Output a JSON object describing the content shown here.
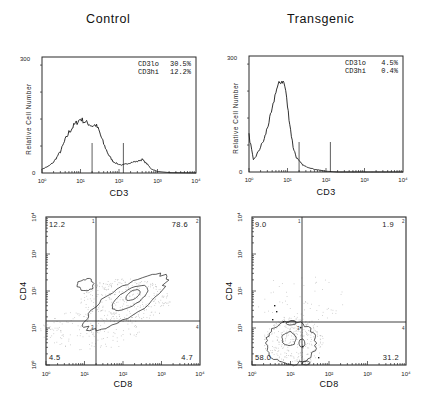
{
  "titles": {
    "left": "Control",
    "right": "Transgenic"
  },
  "colors": {
    "ink": "#1a1a1a",
    "frame": "#2a2a2a",
    "dots": "#bdbdbd",
    "background": "#ffffff"
  },
  "histogram_axis": {
    "ylabel": "Relative Cell Number",
    "xlabel": "CD3",
    "ymax_label": "300",
    "ymin_label": "0",
    "x_ticks": [
      "10⁰",
      "10¹",
      "10²",
      "10³",
      "10⁴"
    ]
  },
  "dotplot_axis": {
    "xlabel": "CD8",
    "ylabel": "CD4",
    "x_ticks": [
      "10⁰",
      "10¹",
      "10²",
      "10³",
      "10⁴"
    ],
    "y_ticks": [
      "10⁰",
      "10¹",
      "10²",
      "10³",
      "10⁴"
    ],
    "quadrant_numbers": [
      "1",
      "2",
      "3",
      "4"
    ]
  },
  "control": {
    "stats": [
      {
        "label": "CD3lo",
        "value": "30.5%"
      },
      {
        "label": "CD3hi",
        "value": "12.2%"
      }
    ],
    "quadrants": {
      "ul": "12.2",
      "ur": "78.6",
      "ll": "4.5",
      "lr": "4.7"
    }
  },
  "transgenic": {
    "stats": [
      {
        "label": "CD3lo",
        "value": "4.5%"
      },
      {
        "label": "CD3hi",
        "value": "0.4%"
      }
    ],
    "quadrants": {
      "ul": "9.0",
      "ur": "1.9",
      "ll": "58.0",
      "lr": "31.2"
    }
  },
  "chart_data": [
    {
      "type": "line",
      "title": "Control",
      "xlabel": "CD3",
      "ylabel": "Relative Cell Number",
      "xscale": "log",
      "xlim": [
        1,
        10000
      ],
      "ylim": [
        0,
        300
      ],
      "gates": [
        20,
        130
      ],
      "annotations": [
        "CD3lo 30.5%",
        "CD3hi 12.2%"
      ],
      "x": [
        1,
        1.5,
        2,
        3,
        4,
        5,
        7,
        10,
        13,
        16,
        20,
        25,
        30,
        40,
        55,
        70,
        90,
        120,
        160,
        220,
        300,
        400,
        550,
        700,
        1000,
        2000,
        10000
      ],
      "y": [
        10,
        18,
        28,
        55,
        85,
        105,
        125,
        140,
        132,
        128,
        122,
        124,
        110,
        75,
        45,
        30,
        24,
        20,
        24,
        28,
        30,
        35,
        22,
        10,
        4,
        1,
        0
      ]
    },
    {
      "type": "line",
      "title": "Transgenic",
      "xlabel": "CD3",
      "ylabel": "Relative Cell Number",
      "xscale": "log",
      "xlim": [
        1,
        10000
      ],
      "ylim": [
        0,
        300
      ],
      "gates": [
        20,
        130
      ],
      "annotations": [
        "CD3lo 4.5%",
        "CD3hi 0.4%"
      ],
      "x": [
        1,
        1.3,
        1.6,
        2,
        2.5,
        3,
        4,
        5,
        6,
        7,
        8,
        9,
        10,
        12,
        14,
        17,
        20,
        25,
        30,
        50,
        100,
        200,
        10000
      ],
      "y": [
        95,
        30,
        45,
        65,
        85,
        115,
        160,
        210,
        228,
        235,
        232,
        210,
        170,
        110,
        65,
        38,
        28,
        18,
        14,
        7,
        2,
        0,
        0
      ]
    },
    {
      "type": "scatter",
      "title": "Control CD4 vs CD8",
      "xlabel": "CD8",
      "ylabel": "CD4",
      "xscale": "log",
      "yscale": "log",
      "xlim": [
        1,
        10000
      ],
      "ylim": [
        1,
        10000
      ],
      "quadrant_gates": {
        "x": 22,
        "y": 16
      },
      "quadrants_percent": {
        "CD4+CD8-": 12.2,
        "CD4+CD8+": 78.6,
        "CD4-CD8-": 4.5,
        "CD4-CD8+": 4.7
      }
    },
    {
      "type": "scatter",
      "title": "Transgenic CD4 vs CD8",
      "xlabel": "CD8",
      "ylabel": "CD4",
      "xscale": "log",
      "yscale": "log",
      "xlim": [
        1,
        10000
      ],
      "ylim": [
        1,
        10000
      ],
      "quadrant_gates": {
        "x": 22,
        "y": 16
      },
      "quadrants_percent": {
        "CD4+CD8-": 9.0,
        "CD4+CD8+": 1.9,
        "CD4-CD8-": 58.0,
        "CD4-CD8+": 31.2
      }
    }
  ]
}
